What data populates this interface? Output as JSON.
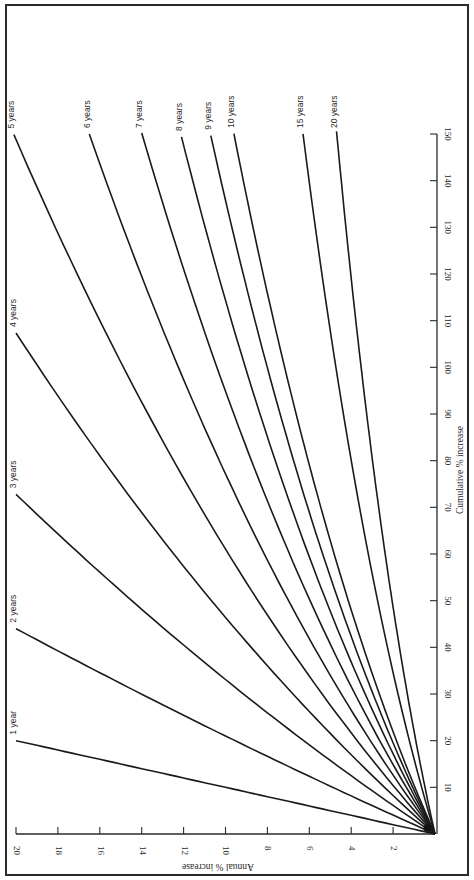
{
  "chart_data": {
    "type": "line",
    "orientation_note": "figure rotated 90 degrees on page",
    "title": "",
    "xlabel": "Annual % increase",
    "ylabel": "Cumulative % increase",
    "xlim": [
      0,
      20
    ],
    "ylim": [
      0,
      150
    ],
    "x_ticks": [
      2,
      4,
      6,
      8,
      10,
      12,
      14,
      16,
      18,
      20
    ],
    "y_ticks": [
      10,
      20,
      30,
      40,
      50,
      60,
      70,
      80,
      90,
      100,
      110,
      120,
      130,
      140,
      150
    ],
    "grid": false,
    "legend": "inline labels at curve ends",
    "formula": "cumulative = (1 + annual/100)^years - 1",
    "series": [
      {
        "name": "1 year",
        "years": 1,
        "end": {
          "annual": 20.0,
          "cumulative": 20.0
        }
      },
      {
        "name": "2 years",
        "years": 2,
        "end": {
          "annual": 20.0,
          "cumulative": 44.0
        }
      },
      {
        "name": "3 years",
        "years": 3,
        "end": {
          "annual": 20.0,
          "cumulative": 72.8
        }
      },
      {
        "name": "4 years",
        "years": 4,
        "end": {
          "annual": 20.0,
          "cumulative": 107.4
        }
      },
      {
        "name": "5 years",
        "years": 5,
        "end": {
          "annual": 20.1,
          "cumulative": 150
        }
      },
      {
        "name": "6 years",
        "years": 6,
        "end": {
          "annual": 16.5,
          "cumulative": 150
        }
      },
      {
        "name": "7 years",
        "years": 7,
        "end": {
          "annual": 14.0,
          "cumulative": 150
        }
      },
      {
        "name": "8 years",
        "years": 8,
        "end": {
          "annual": 12.1,
          "cumulative": 150
        }
      },
      {
        "name": "9 years",
        "years": 9,
        "end": {
          "annual": 10.7,
          "cumulative": 150
        }
      },
      {
        "name": "10 years",
        "years": 10,
        "end": {
          "annual": 9.6,
          "cumulative": 150
        }
      },
      {
        "name": "15 years",
        "years": 15,
        "end": {
          "annual": 6.3,
          "cumulative": 150
        }
      },
      {
        "name": "20 years",
        "years": 20,
        "end": {
          "annual": 4.7,
          "cumulative": 150
        }
      }
    ]
  },
  "layout": {
    "annual_axis": {
      "zero_x": 435,
      "twenty_x": 16,
      "axis_y": 834
    },
    "cumulative_axis": {
      "zero_y": 834,
      "max_y": 134,
      "axis_x": 437
    }
  }
}
